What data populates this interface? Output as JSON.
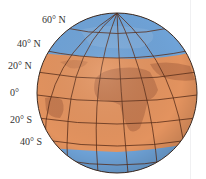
{
  "figure": {
    "latitude_labels": [
      {
        "text": "60° N",
        "x": 42,
        "y": 15
      },
      {
        "text": "40° N",
        "x": 17,
        "y": 39
      },
      {
        "text": "20° N",
        "x": 8,
        "y": 61
      },
      {
        "text": "0°",
        "x": 10,
        "y": 88
      },
      {
        "text": "20° S",
        "x": 10,
        "y": 115
      },
      {
        "text": "40° S",
        "x": 20,
        "y": 137
      }
    ],
    "bands": [
      {
        "name": "north-polar",
        "color": "#6fa3d8"
      },
      {
        "name": "tropical",
        "color": "#e3935f"
      },
      {
        "name": "south-polar",
        "color": "#6fa3d8"
      }
    ],
    "land_color": "#c27650",
    "grid_color": "#5a2f1a"
  }
}
